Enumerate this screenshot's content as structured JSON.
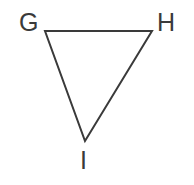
{
  "figure": {
    "type": "triangle-diagram",
    "background_color": "#ffffff",
    "stroke_color": "#3a3a3a",
    "stroke_width": 2,
    "label_color": "#3a3a3a",
    "canvas": {
      "width": 194,
      "height": 185
    },
    "vertices": [
      {
        "id": "G",
        "label": "G",
        "x": 45,
        "y": 31,
        "label_x": 19,
        "label_y": 10
      },
      {
        "id": "H",
        "label": "H",
        "x": 152,
        "y": 31,
        "label_x": 157,
        "label_y": 10
      },
      {
        "id": "I",
        "label": "I",
        "x": 85,
        "y": 141,
        "label_x": 80,
        "label_y": 148
      }
    ],
    "edges": [
      {
        "from": "G",
        "to": "H",
        "name": "edge-gh"
      },
      {
        "from": "H",
        "to": "I",
        "name": "edge-hi"
      },
      {
        "from": "I",
        "to": "G",
        "name": "edge-ig"
      }
    ],
    "polygon_points": "45,31 152,31 85,141"
  }
}
